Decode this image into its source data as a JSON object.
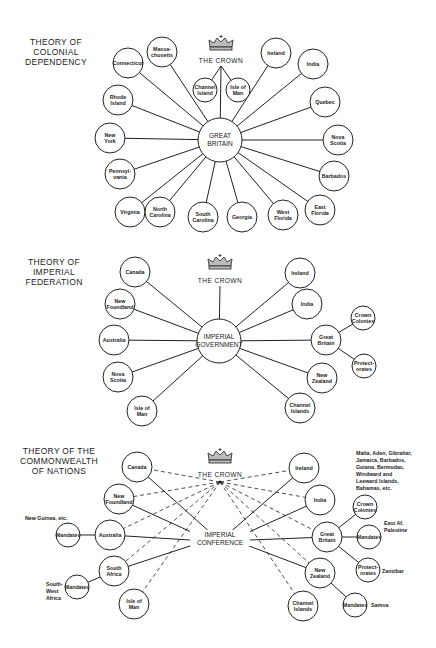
{
  "diagrams": [
    {
      "title_lines": [
        "THEORY OF",
        "COLONIAL",
        "DEPENDENCY"
      ],
      "crown_label": "THE CROWN",
      "hub_lines": [
        "GREAT",
        "BRITAIN"
      ],
      "nodes": [
        {
          "id": "massachusetts",
          "lines": [
            "Massa-",
            "chusetts"
          ]
        },
        {
          "id": "connecticut",
          "lines": [
            "Connecticut"
          ]
        },
        {
          "id": "rhode-island",
          "lines": [
            "Rhode",
            "Island"
          ]
        },
        {
          "id": "new-york",
          "lines": [
            "New",
            "York"
          ]
        },
        {
          "id": "pennsylvania",
          "lines": [
            "Pennsyl-",
            "vania"
          ]
        },
        {
          "id": "virginia",
          "lines": [
            "Virginia"
          ]
        },
        {
          "id": "north-carolina",
          "lines": [
            "North",
            "Carolina"
          ]
        },
        {
          "id": "south-carolina",
          "lines": [
            "South",
            "Carolina"
          ]
        },
        {
          "id": "georgia",
          "lines": [
            "Georgia"
          ]
        },
        {
          "id": "west-florida",
          "lines": [
            "West",
            "Florida"
          ]
        },
        {
          "id": "east-florida",
          "lines": [
            "East",
            "Florida"
          ]
        },
        {
          "id": "barbados",
          "lines": [
            "Barbados"
          ]
        },
        {
          "id": "nova-scotia",
          "lines": [
            "Nova",
            "Scotia"
          ]
        },
        {
          "id": "quebec",
          "lines": [
            "Quebec"
          ]
        },
        {
          "id": "india",
          "lines": [
            "India"
          ]
        },
        {
          "id": "ireland",
          "lines": [
            "Ireland"
          ]
        },
        {
          "id": "channel-island",
          "lines": [
            "Channel",
            "Island"
          ]
        },
        {
          "id": "isle-of-man",
          "lines": [
            "Isle of",
            "Man"
          ]
        }
      ]
    },
    {
      "title_lines": [
        "THEORY OF",
        "IMPERIAL",
        "FEDERATION"
      ],
      "crown_label": "THE CROWN",
      "hub_lines": [
        "IMPERIAL",
        "GOVERNMENT"
      ],
      "nodes": [
        {
          "id": "canada",
          "lines": [
            "Canada"
          ]
        },
        {
          "id": "new-foundland",
          "lines": [
            "New",
            "Foundland"
          ]
        },
        {
          "id": "australia",
          "lines": [
            "Australia"
          ]
        },
        {
          "id": "nova-scotia",
          "lines": [
            "Nova",
            "Scotia"
          ]
        },
        {
          "id": "isle-of-man",
          "lines": [
            "Isle of",
            "Man"
          ]
        },
        {
          "id": "ireland",
          "lines": [
            "Ireland"
          ]
        },
        {
          "id": "india",
          "lines": [
            "India"
          ]
        },
        {
          "id": "great-britain",
          "lines": [
            "Great",
            "Britain"
          ]
        },
        {
          "id": "crown-colonies",
          "lines": [
            "Crown",
            "Colonies"
          ]
        },
        {
          "id": "protectorates",
          "lines": [
            "Protect-",
            "orates"
          ]
        },
        {
          "id": "new-zealand",
          "lines": [
            "New",
            "Zealand"
          ]
        },
        {
          "id": "channel-islands",
          "lines": [
            "Channel",
            "Islands"
          ]
        }
      ]
    },
    {
      "title_lines": [
        "THEORY OF THE",
        "COMMONWEALTH",
        "OF NATIONS"
      ],
      "crown_label": "THE CROWN",
      "hub_lines": [
        "IMPERIAL",
        "CONFERENCE"
      ],
      "nodes": [
        {
          "id": "canada",
          "lines": [
            "Canada"
          ]
        },
        {
          "id": "new-foundland",
          "lines": [
            "New",
            "Foundland"
          ]
        },
        {
          "id": "australia",
          "lines": [
            "Australia"
          ]
        },
        {
          "id": "mandates-new-guinea",
          "lines": [
            "Mandates"
          ]
        },
        {
          "id": "south-africa",
          "lines": [
            "South",
            "Africa"
          ]
        },
        {
          "id": "mandates-south-west-africa",
          "lines": [
            "Mandates"
          ]
        },
        {
          "id": "isle-of-man",
          "lines": [
            "Isle of",
            "Man"
          ]
        },
        {
          "id": "ireland",
          "lines": [
            "Ireland"
          ]
        },
        {
          "id": "india",
          "lines": [
            "India"
          ]
        },
        {
          "id": "great-britain",
          "lines": [
            "Great",
            "Britain"
          ]
        },
        {
          "id": "crown-colonies",
          "lines": [
            "Crown",
            "Colonies"
          ]
        },
        {
          "id": "mandates-east-africa",
          "lines": [
            "Mandates"
          ]
        },
        {
          "id": "protectorates",
          "lines": [
            "Protect-",
            "orates"
          ]
        },
        {
          "id": "new-zealand",
          "lines": [
            "New",
            "Zealand"
          ]
        },
        {
          "id": "mandates-samoa",
          "lines": [
            "Mandates"
          ]
        },
        {
          "id": "channel-islands",
          "lines": [
            "Channel",
            "Islands"
          ]
        }
      ],
      "annotations": {
        "new_guinea": "New Guinea, etc.",
        "south_west_africa": [
          "South-",
          "West",
          "Africa"
        ],
        "crown_colonies_list": [
          "Malta, Aden, Gibraltar,",
          "Jamaica, Barbados,",
          "Guiana, Bermudas,",
          "Windward and",
          "Leeward Islands,",
          "Bahamas, etc."
        ],
        "east_africa": [
          "East Af.",
          "Palestine"
        ],
        "zanzibar": "Zanzibar",
        "samoa": "Samoa"
      }
    }
  ],
  "colors": {
    "ink": "#222222",
    "background": "#ffffff"
  }
}
